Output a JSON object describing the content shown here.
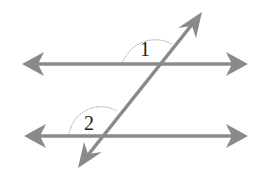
{
  "diagram": {
    "colors": {
      "line": "#8a8a8a",
      "arc": "#999999",
      "label": "#1a1a1a",
      "background": "#ffffff"
    },
    "lines": [
      {
        "name": "top-parallel-line",
        "x1": 24,
        "y1": 64,
        "x2": 246,
        "y2": 64
      },
      {
        "name": "bottom-parallel-line",
        "x1": 26,
        "y1": 136,
        "x2": 246,
        "y2": 136
      },
      {
        "name": "transversal",
        "x1": 80,
        "y1": 165,
        "x2": 201,
        "y2": 13
      }
    ],
    "angles": [
      {
        "label": "1",
        "vertex": [
          157,
          64
        ],
        "radius": 35
      },
      {
        "label": "2",
        "vertex": [
          100,
          136
        ],
        "radius": 32
      }
    ]
  }
}
